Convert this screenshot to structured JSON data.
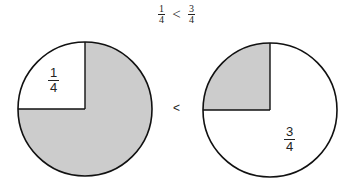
{
  "title": {
    "left": {
      "numerator": "1",
      "denominator": "4"
    },
    "operator": "<",
    "right": {
      "numerator": "3",
      "denominator": "4"
    }
  },
  "diagram": {
    "left_circle": {
      "label": {
        "numerator": "1",
        "denominator": "4"
      },
      "shaded_fraction": "3/4",
      "unshaded_quadrant": "top-left"
    },
    "comparison": "<",
    "right_circle": {
      "label": {
        "numerator": "3",
        "denominator": "4"
      },
      "shaded_fraction": "1/4",
      "shaded_quadrant": "top-left"
    },
    "colors": {
      "shade": "#cccccc",
      "stroke": "#111111",
      "background": "#ffffff"
    }
  }
}
